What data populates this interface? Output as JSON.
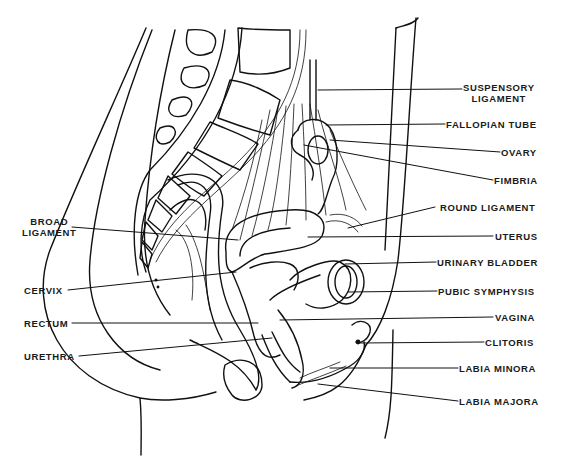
{
  "figure": {
    "labels_right": [
      {
        "id": "suspensory-ligament",
        "lines": [
          "SUSPENSORY",
          "LIGAMENT"
        ]
      },
      {
        "id": "fallopian-tube",
        "lines": [
          "FALLOPIAN TUBE"
        ]
      },
      {
        "id": "ovary",
        "lines": [
          "OVARY"
        ]
      },
      {
        "id": "fimbria",
        "lines": [
          "FIMBRIA"
        ]
      },
      {
        "id": "round-ligament",
        "lines": [
          "ROUND LIGAMENT"
        ]
      },
      {
        "id": "uterus",
        "lines": [
          "UTERUS"
        ]
      },
      {
        "id": "urinary-bladder",
        "lines": [
          "URINARY BLADDER"
        ]
      },
      {
        "id": "pubic-symphysis",
        "lines": [
          "PUBIC SYMPHYSIS"
        ]
      },
      {
        "id": "vagina",
        "lines": [
          "VAGINA"
        ]
      },
      {
        "id": "clitoris",
        "lines": [
          "CLITORIS"
        ]
      },
      {
        "id": "labia-minora",
        "lines": [
          "LABIA MINORA"
        ]
      },
      {
        "id": "labia-majora",
        "lines": [
          "LABIA MAJORA"
        ]
      }
    ],
    "labels_left": [
      {
        "id": "broad-ligament",
        "lines": [
          "BROAD",
          "LIGAMENT"
        ]
      },
      {
        "id": "cervix",
        "lines": [
          "CERVIX"
        ]
      },
      {
        "id": "rectum",
        "lines": [
          "RECTUM"
        ]
      },
      {
        "id": "urethra",
        "lines": [
          "URETHRA"
        ]
      }
    ]
  }
}
